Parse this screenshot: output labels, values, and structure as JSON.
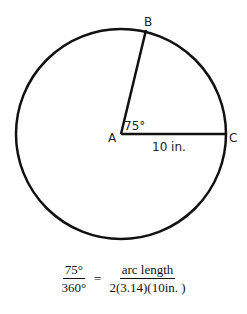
{
  "diagram": {
    "circle": {
      "cx": 121,
      "cy": 134,
      "r": 105,
      "stroke": "#111111"
    },
    "points": {
      "A": {
        "label": "A",
        "x": 121,
        "y": 134
      },
      "B": {
        "label": "B",
        "x": 146,
        "y": 30
      },
      "C": {
        "label": "C",
        "x": 226,
        "y": 134
      }
    },
    "angle_label": "75°",
    "radius_label": "10 in."
  },
  "equation": {
    "left_numerator": "75°",
    "left_denominator": "360°",
    "equals": "=",
    "right_numerator": "arc length",
    "right_denominator": "2(3.14)(10in. )"
  }
}
